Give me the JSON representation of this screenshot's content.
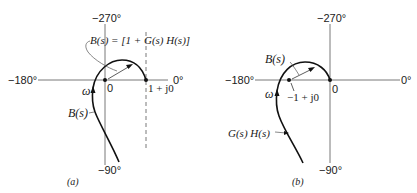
{
  "panel_a": {
    "label_top": "−270°",
    "label_left": "−180°",
    "label_right": "0°",
    "label_bottom": "−90°",
    "origin_label": "0",
    "point_label": "1 + j0",
    "omega_label": "ω",
    "curve_label": "B(s)",
    "equation": "B(s) = [1 + G(s) H(s)]",
    "caption": "(a)"
  },
  "panel_b": {
    "label_top": "−270°",
    "label_left": "−180°",
    "label_right": "0°",
    "label_bottom": "−90°",
    "origin_label": "0",
    "point_label": "−1 + j0",
    "omega_label": "ω",
    "vector_label": "B(s)",
    "curve_label": "G(s) H(s)",
    "caption": "(b)"
  }
}
